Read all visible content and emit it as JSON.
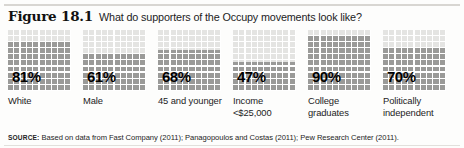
{
  "header": {
    "figure_number": "Figure 18.1",
    "title": "What do supporters of the Occupy movements look like?"
  },
  "source": {
    "keyword": "SOURCE:",
    "text": " Based on data from Fast Company (2011); Panagopoulos and Costas (2011); Pew Research Center (2011)."
  },
  "colors": {
    "grid_empty": "#e4e4e2",
    "grid_filled": "#9a9a98",
    "gridline": "#ffffff",
    "text": "#1c1c1c"
  },
  "chart_data": {
    "type": "bar",
    "title": "What do supporters of the Occupy movements look like?",
    "xlabel": "",
    "ylabel": "",
    "ylim": [
      0,
      100
    ],
    "grid": true,
    "legend": "none",
    "unit": "%",
    "grid_cells": {
      "cols": 10,
      "rows": 10
    },
    "categories": [
      "White",
      "Male",
      "45 and younger",
      "Income <$25,000",
      "College graduates",
      "Politically independent"
    ],
    "values": [
      81,
      61,
      68,
      47,
      90,
      70
    ],
    "value_labels": [
      "81%",
      "61%",
      "68%",
      "47%",
      "90%",
      "70%"
    ]
  },
  "bars": [
    {
      "label": "White",
      "value": 81,
      "value_label": "81%"
    },
    {
      "label": "Male",
      "value": 61,
      "value_label": "61%"
    },
    {
      "label": "45 and younger",
      "value": 68,
      "value_label": "68%"
    },
    {
      "label": "Income <$25,000",
      "value": 47,
      "value_label": "47%"
    },
    {
      "label": "College graduates",
      "value": 90,
      "value_label": "90%"
    },
    {
      "label": "Politically independent",
      "value": 70,
      "value_label": "70%"
    }
  ]
}
